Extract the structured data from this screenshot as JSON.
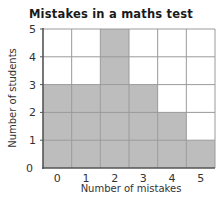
{
  "chart_data": {
    "type": "bar",
    "title": "Mistakes in a maths test",
    "xlabel": "Number of mistakes",
    "ylabel": "Number of students",
    "categories": [
      "0",
      "1",
      "2",
      "3",
      "4",
      "5"
    ],
    "values": [
      3,
      3,
      5,
      3,
      2,
      1
    ],
    "yticks": [
      "0",
      "1",
      "2",
      "3",
      "4",
      "5"
    ],
    "ylim": [
      0,
      5
    ],
    "grid": true,
    "legend": null,
    "colors": {
      "bar": "#bdbdbd",
      "grid": "#9a9a9a",
      "axis": "#555555"
    }
  }
}
